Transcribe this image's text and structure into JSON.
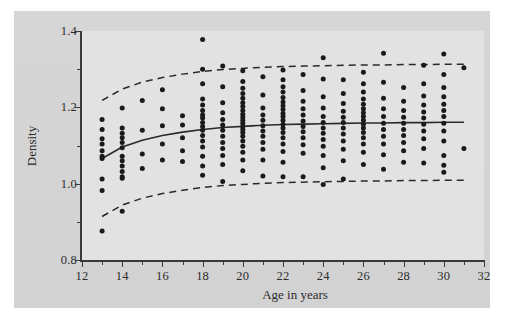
{
  "chart_data": {
    "type": "scatter",
    "title": "",
    "xlabel": "Age in years",
    "ylabel": "Density",
    "xlim": [
      12,
      32
    ],
    "ylim": [
      0.8,
      1.4
    ],
    "grid": false,
    "legend": "none",
    "x_ticks_major": [
      12,
      14,
      16,
      18,
      20,
      22,
      24,
      26,
      28,
      30,
      32
    ],
    "x_ticks_minor": [
      13,
      15,
      17,
      19,
      21,
      23,
      25,
      27,
      29,
      31
    ],
    "x_tick_labels": [
      "12",
      "14",
      "16",
      "18",
      "20",
      "22",
      "24",
      "26",
      "28",
      "30",
      "32"
    ],
    "y_ticks_major": [
      0.8,
      1.0,
      1.2,
      1.4
    ],
    "y_ticks_minor": [
      0.9,
      1.1,
      1.3
    ],
    "y_tick_labels": [
      "0.8",
      "1.0",
      "1.2",
      "1.4"
    ],
    "series": [
      {
        "name": "observations",
        "type": "scatter",
        "marker": "circle",
        "color": "#1a1a1a",
        "points": [
          [
            13,
            1.168
          ],
          [
            13,
            1.142
          ],
          [
            13,
            1.118
          ],
          [
            13,
            1.104
          ],
          [
            13,
            1.086
          ],
          [
            13,
            1.072
          ],
          [
            13,
            1.066
          ],
          [
            13,
            1.012
          ],
          [
            13,
            0.982
          ],
          [
            13,
            0.876
          ],
          [
            14,
            1.198
          ],
          [
            14,
            1.146
          ],
          [
            14,
            1.132
          ],
          [
            14,
            1.12
          ],
          [
            14,
            1.108
          ],
          [
            14,
            1.094
          ],
          [
            14,
            1.072
          ],
          [
            14,
            1.06
          ],
          [
            14,
            1.046
          ],
          [
            14,
            1.032
          ],
          [
            14,
            1.018
          ],
          [
            14,
            1.014
          ],
          [
            14,
            0.928
          ],
          [
            15,
            1.218
          ],
          [
            15,
            1.14
          ],
          [
            15,
            1.078
          ],
          [
            15,
            1.04
          ],
          [
            16,
            1.246
          ],
          [
            16,
            1.196
          ],
          [
            16,
            1.152
          ],
          [
            16,
            1.104
          ],
          [
            16,
            1.062
          ],
          [
            17,
            1.178
          ],
          [
            17,
            1.154
          ],
          [
            17,
            1.12
          ],
          [
            17,
            1.086
          ],
          [
            17,
            1.058
          ],
          [
            18,
            1.378
          ],
          [
            18,
            1.3
          ],
          [
            18,
            1.262
          ],
          [
            18,
            1.222
          ],
          [
            18,
            1.206
          ],
          [
            18,
            1.192
          ],
          [
            18,
            1.18
          ],
          [
            18,
            1.172
          ],
          [
            18,
            1.16
          ],
          [
            18,
            1.15
          ],
          [
            18,
            1.14
          ],
          [
            18,
            1.126
          ],
          [
            18,
            1.112
          ],
          [
            18,
            1.096
          ],
          [
            18,
            1.072
          ],
          [
            18,
            1.046
          ],
          [
            18,
            1.022
          ],
          [
            19,
            1.308
          ],
          [
            19,
            1.254
          ],
          [
            19,
            1.212
          ],
          [
            19,
            1.186
          ],
          [
            19,
            1.168
          ],
          [
            19,
            1.154
          ],
          [
            19,
            1.14
          ],
          [
            19,
            1.124
          ],
          [
            19,
            1.108
          ],
          [
            19,
            1.092
          ],
          [
            19,
            1.074
          ],
          [
            19,
            1.05
          ],
          [
            19,
            1.006
          ],
          [
            20,
            1.296
          ],
          [
            20,
            1.268
          ],
          [
            20,
            1.25
          ],
          [
            20,
            1.236
          ],
          [
            20,
            1.224
          ],
          [
            20,
            1.212
          ],
          [
            20,
            1.202
          ],
          [
            20,
            1.192
          ],
          [
            20,
            1.182
          ],
          [
            20,
            1.174
          ],
          [
            20,
            1.166
          ],
          [
            20,
            1.158
          ],
          [
            20,
            1.15
          ],
          [
            20,
            1.142
          ],
          [
            20,
            1.134
          ],
          [
            20,
            1.124
          ],
          [
            20,
            1.112
          ],
          [
            20,
            1.098
          ],
          [
            20,
            1.082
          ],
          [
            20,
            1.062
          ],
          [
            20,
            1.034
          ],
          [
            21,
            1.28
          ],
          [
            21,
            1.232
          ],
          [
            21,
            1.198
          ],
          [
            21,
            1.18
          ],
          [
            21,
            1.166
          ],
          [
            21,
            1.152
          ],
          [
            21,
            1.138
          ],
          [
            21,
            1.124
          ],
          [
            21,
            1.108
          ],
          [
            21,
            1.09
          ],
          [
            21,
            1.062
          ],
          [
            21,
            1.02
          ],
          [
            22,
            1.298
          ],
          [
            22,
            1.272
          ],
          [
            22,
            1.254
          ],
          [
            22,
            1.24
          ],
          [
            22,
            1.226
          ],
          [
            22,
            1.214
          ],
          [
            22,
            1.204
          ],
          [
            22,
            1.194
          ],
          [
            22,
            1.184
          ],
          [
            22,
            1.176
          ],
          [
            22,
            1.166
          ],
          [
            22,
            1.156
          ],
          [
            22,
            1.146
          ],
          [
            22,
            1.134
          ],
          [
            22,
            1.12
          ],
          [
            22,
            1.104
          ],
          [
            22,
            1.084
          ],
          [
            22,
            1.056
          ],
          [
            22,
            1.018
          ],
          [
            23,
            1.286
          ],
          [
            23,
            1.244
          ],
          [
            23,
            1.216
          ],
          [
            23,
            1.196
          ],
          [
            23,
            1.18
          ],
          [
            23,
            1.164
          ],
          [
            23,
            1.15
          ],
          [
            23,
            1.136
          ],
          [
            23,
            1.12
          ],
          [
            23,
            1.102
          ],
          [
            23,
            1.08
          ],
          [
            23,
            1.018
          ],
          [
            24,
            1.33
          ],
          [
            24,
            1.274
          ],
          [
            24,
            1.228
          ],
          [
            24,
            1.198
          ],
          [
            24,
            1.176
          ],
          [
            24,
            1.16
          ],
          [
            24,
            1.146
          ],
          [
            24,
            1.132
          ],
          [
            24,
            1.116
          ],
          [
            24,
            1.098
          ],
          [
            24,
            1.074
          ],
          [
            24,
            1.042
          ],
          [
            24,
            0.998
          ],
          [
            25,
            1.272
          ],
          [
            25,
            1.236
          ],
          [
            25,
            1.21
          ],
          [
            25,
            1.19
          ],
          [
            25,
            1.174
          ],
          [
            25,
            1.16
          ],
          [
            25,
            1.146
          ],
          [
            25,
            1.13
          ],
          [
            25,
            1.112
          ],
          [
            25,
            1.09
          ],
          [
            25,
            1.06
          ],
          [
            25,
            1.012
          ],
          [
            26,
            1.292
          ],
          [
            26,
            1.262
          ],
          [
            26,
            1.24
          ],
          [
            26,
            1.222
          ],
          [
            26,
            1.208
          ],
          [
            26,
            1.196
          ],
          [
            26,
            1.186
          ],
          [
            26,
            1.176
          ],
          [
            26,
            1.166
          ],
          [
            26,
            1.156
          ],
          [
            26,
            1.146
          ],
          [
            26,
            1.134
          ],
          [
            26,
            1.12
          ],
          [
            26,
            1.104
          ],
          [
            26,
            1.082
          ],
          [
            26,
            1.05
          ],
          [
            27,
            1.342
          ],
          [
            27,
            1.266
          ],
          [
            27,
            1.224
          ],
          [
            27,
            1.196
          ],
          [
            27,
            1.176
          ],
          [
            27,
            1.158
          ],
          [
            27,
            1.142
          ],
          [
            27,
            1.124
          ],
          [
            27,
            1.104
          ],
          [
            27,
            1.076
          ],
          [
            27,
            1.038
          ],
          [
            28,
            1.252
          ],
          [
            28,
            1.216
          ],
          [
            28,
            1.192
          ],
          [
            28,
            1.174
          ],
          [
            28,
            1.158
          ],
          [
            28,
            1.142
          ],
          [
            28,
            1.126
          ],
          [
            28,
            1.108
          ],
          [
            28,
            1.086
          ],
          [
            28,
            1.056
          ],
          [
            29,
            1.31
          ],
          [
            29,
            1.262
          ],
          [
            29,
            1.23
          ],
          [
            29,
            1.206
          ],
          [
            29,
            1.188
          ],
          [
            29,
            1.172
          ],
          [
            29,
            1.156
          ],
          [
            29,
            1.138
          ],
          [
            29,
            1.118
          ],
          [
            29,
            1.092
          ],
          [
            29,
            1.054
          ],
          [
            30,
            1.34
          ],
          [
            30,
            1.286
          ],
          [
            30,
            1.252
          ],
          [
            30,
            1.228
          ],
          [
            30,
            1.208
          ],
          [
            30,
            1.192
          ],
          [
            30,
            1.176
          ],
          [
            30,
            1.158
          ],
          [
            30,
            1.138
          ],
          [
            30,
            1.112
          ],
          [
            30,
            1.074
          ],
          [
            30,
            1.048
          ],
          [
            30,
            1.03
          ],
          [
            31,
            1.304
          ],
          [
            31,
            1.092
          ]
        ]
      },
      {
        "name": "fitted-mean-curve",
        "type": "line",
        "style": "solid",
        "color": "#2a2a2a",
        "points": [
          [
            13,
            1.066
          ],
          [
            14,
            1.096
          ],
          [
            15,
            1.114
          ],
          [
            16,
            1.126
          ],
          [
            17,
            1.135
          ],
          [
            18,
            1.142
          ],
          [
            19,
            1.147
          ],
          [
            20,
            1.15
          ],
          [
            21,
            1.153
          ],
          [
            22,
            1.155
          ],
          [
            23,
            1.156
          ],
          [
            24,
            1.157
          ],
          [
            25,
            1.158
          ],
          [
            26,
            1.159
          ],
          [
            27,
            1.159
          ],
          [
            28,
            1.16
          ],
          [
            29,
            1.16
          ],
          [
            30,
            1.161
          ],
          [
            31,
            1.161
          ]
        ]
      },
      {
        "name": "upper-band",
        "type": "line",
        "style": "dashed",
        "color": "#2a2a2a",
        "points": [
          [
            13,
            1.218
          ],
          [
            14,
            1.248
          ],
          [
            15,
            1.266
          ],
          [
            16,
            1.278
          ],
          [
            17,
            1.287
          ],
          [
            18,
            1.294
          ],
          [
            19,
            1.299
          ],
          [
            20,
            1.302
          ],
          [
            21,
            1.305
          ],
          [
            22,
            1.307
          ],
          [
            23,
            1.308
          ],
          [
            24,
            1.309
          ],
          [
            25,
            1.31
          ],
          [
            26,
            1.311
          ],
          [
            27,
            1.311
          ],
          [
            28,
            1.312
          ],
          [
            29,
            1.312
          ],
          [
            30,
            1.313
          ],
          [
            31,
            1.313
          ]
        ]
      },
      {
        "name": "lower-band",
        "type": "line",
        "style": "dashed",
        "color": "#2a2a2a",
        "points": [
          [
            13,
            0.914
          ],
          [
            14,
            0.944
          ],
          [
            15,
            0.962
          ],
          [
            16,
            0.974
          ],
          [
            17,
            0.983
          ],
          [
            18,
            0.99
          ],
          [
            19,
            0.995
          ],
          [
            20,
            0.998
          ],
          [
            21,
            1.001
          ],
          [
            22,
            1.003
          ],
          [
            23,
            1.004
          ],
          [
            24,
            1.005
          ],
          [
            25,
            1.006
          ],
          [
            26,
            1.007
          ],
          [
            27,
            1.007
          ],
          [
            28,
            1.008
          ],
          [
            29,
            1.008
          ],
          [
            30,
            1.009
          ],
          [
            31,
            1.009
          ]
        ]
      }
    ]
  }
}
